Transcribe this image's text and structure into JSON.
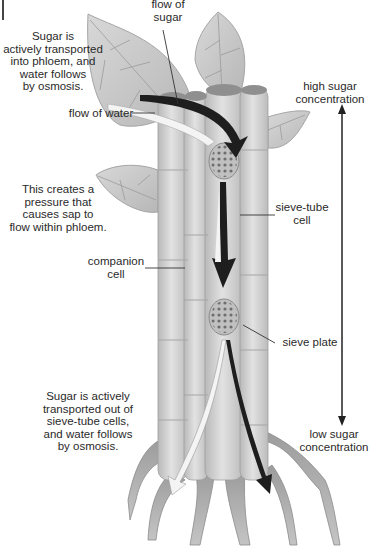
{
  "diagram": {
    "labels": {
      "flow_of_sugar": "flow of\nsugar",
      "sugar_into_phloem": "Sugar is\nactively transported\ninto phloem, and\nwater follows\nby osmosis.",
      "flow_of_water": "flow of water",
      "high_sugar": "high sugar\nconcentration",
      "pressure": "This creates a\npressure that\ncauses sap to\nflow within phloem.",
      "sieve_tube_cell": "sieve-tube\ncell",
      "companion_cell": "companion\ncell",
      "sieve_plate": "sieve plate",
      "sugar_out": "Sugar is actively\ntransported out of\nsieve-tube cells,\nand water follows\nby osmosis.",
      "low_sugar": "low sugar\nconcentration"
    },
    "colors": {
      "leaf": "#c9c9c9",
      "leaf_vein": "#9a9a9a",
      "stem": "#d6d6d6",
      "stem_shadow": "#b4b4b4",
      "sieve_plate": "#bdbdbd",
      "sugar_arrow": "#1e1e1e",
      "water_arrow": "#f4f4f4",
      "root": "#a8a8a8",
      "leader_line": "#333333"
    }
  }
}
